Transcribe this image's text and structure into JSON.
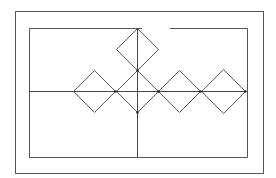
{
  "diagram": {
    "type": "line-drawing",
    "colors": {
      "background": "#ffffff",
      "stroke": "#555555",
      "axis": "#444444",
      "node": "#222222"
    },
    "outer_frame": {
      "x": 15,
      "y": 11,
      "w": 248,
      "h": 162
    },
    "inner_frame": {
      "x": 29,
      "y": 28,
      "w": 218,
      "h": 129,
      "top_gap": [
        142,
        170
      ]
    },
    "axes": {
      "horizontal": {
        "y": 91,
        "x1": 29,
        "x2": 245
      },
      "vertical": {
        "x": 137,
        "y1": 28,
        "y2": 157
      }
    },
    "diamonds": [
      {
        "id": "diamond-top",
        "cx": 137,
        "cy": 49,
        "r": 21
      },
      {
        "id": "diamond-left",
        "cx": 94,
        "cy": 91,
        "r": 21
      },
      {
        "id": "diamond-center",
        "cx": 137,
        "cy": 91,
        "r": 21
      },
      {
        "id": "diamond-right-1",
        "cx": 179,
        "cy": 91,
        "r": 21
      },
      {
        "id": "diamond-right-2",
        "cx": 223,
        "cy": 91,
        "r": 22
      }
    ],
    "nodes": [
      {
        "x": 137,
        "y": 70
      },
      {
        "x": 115,
        "y": 91
      },
      {
        "x": 158,
        "y": 91
      },
      {
        "x": 200,
        "y": 91
      },
      {
        "x": 245,
        "y": 91
      },
      {
        "x": 137,
        "y": 112
      }
    ]
  }
}
